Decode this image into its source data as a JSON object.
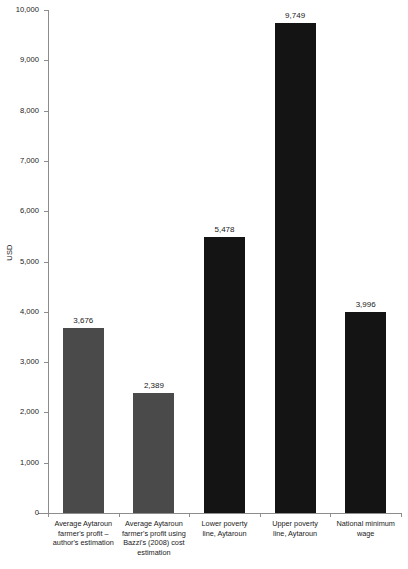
{
  "chart_data": {
    "type": "bar",
    "title": "",
    "xlabel": "",
    "ylabel": "USD",
    "ylim": [
      0,
      10000
    ],
    "grid": false,
    "legend": "none",
    "ytick_labels": [
      "10,000",
      "9,000",
      "8,000",
      "7,000",
      "6,000",
      "5,000",
      "4,000",
      "3,000",
      "2,000",
      "1,000",
      "0"
    ],
    "ytick_values": [
      10000,
      9000,
      8000,
      7000,
      6000,
      5000,
      4000,
      3000,
      2000,
      1000,
      0
    ],
    "categories": [
      "Average Aytaroun farmer's profit – author's estimation",
      "Average Aytaroun farmer's profit using Bazzi's (2008) cost estimation",
      "Lower poverty line, Aytaroun",
      "Upper poverty line, Aytaroun",
      "National minimum wage"
    ],
    "category_lines": [
      [
        "Average Aytaroun",
        "farmer's profit –",
        "author's estimation"
      ],
      [
        "Average Aytaroun",
        "farmer's profit using",
        "Bazzi's (2008) cost",
        "estimation"
      ],
      [
        "Lower poverty",
        "line, Aytaroun"
      ],
      [
        "Upper poverty",
        "line, Aytaroun"
      ],
      [
        "National minimum",
        "wage"
      ]
    ],
    "values": [
      3676,
      2389,
      5478,
      9749,
      3996
    ],
    "value_labels": [
      "3,676",
      "2,389",
      "5,478",
      "9,749",
      "3,996"
    ],
    "bar_colors": [
      "#4a4a4a",
      "#4a4a4a",
      "#141414",
      "#141414",
      "#141414"
    ]
  },
  "colors": {
    "background": "#ffffff",
    "axis": "#8d8d8d",
    "text": "#1a1a1a",
    "bar_gray": "#4a4a4a",
    "bar_black": "#141414"
  }
}
